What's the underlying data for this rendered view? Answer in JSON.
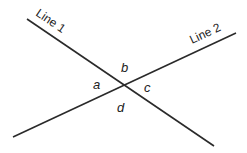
{
  "diagram": {
    "lines": [
      {
        "label": "Line 1",
        "x1": 27,
        "y1": 19,
        "x2": 214,
        "y2": 146
      },
      {
        "label": "Line 2",
        "x1": 13,
        "y1": 137,
        "x2": 236,
        "y2": 33
      }
    ],
    "angles": {
      "a": "a",
      "b": "b",
      "c": "c",
      "d": "d"
    },
    "stroke_color": "#2a2a2a"
  }
}
